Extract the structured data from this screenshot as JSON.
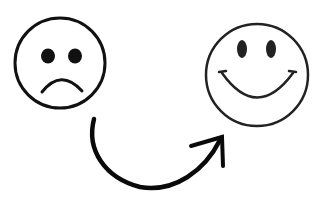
{
  "illustration": {
    "description": "Sad face transforms into happy face via curved arrow",
    "sad_face": {
      "label": "sad-face",
      "stroke": "#111111"
    },
    "happy_face": {
      "label": "happy-face",
      "stroke": "#222222"
    },
    "arrow": {
      "direction": "left-to-right",
      "color": "#0a0a0a"
    }
  },
  "colors": {
    "background": "#ffffff",
    "ink": "#111111"
  }
}
